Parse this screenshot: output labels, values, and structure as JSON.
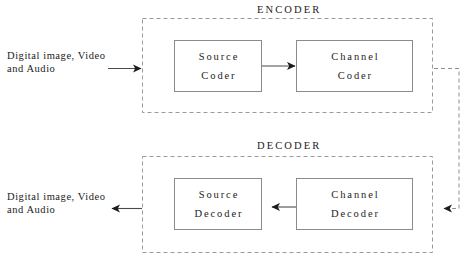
{
  "diagram": {
    "title_encoder": "ENCODER",
    "title_decoder": "DECODER",
    "input_label": "Digital image, Video\nand Audio",
    "output_label": "Digital image, Video\nand Audio",
    "blocks": [
      {
        "name": "source-coder",
        "line1": "Source",
        "line2": "Coder"
      },
      {
        "name": "channel-coder",
        "line1": "Channel",
        "line2": "Coder"
      },
      {
        "name": "source-decoder",
        "line1": "Source",
        "line2": "Decoder"
      },
      {
        "name": "channel-decoder",
        "line1": "Channel",
        "line2": "Decoder"
      }
    ],
    "connections": [
      {
        "name": "input-to-encoder",
        "style": "solid",
        "direction": "right"
      },
      {
        "name": "source-coder-to-channel-coder",
        "style": "solid",
        "direction": "right"
      },
      {
        "name": "channel-coder-to-channel-decoder",
        "style": "dashed",
        "direction": "left"
      },
      {
        "name": "channel-decoder-to-source-decoder",
        "style": "solid",
        "direction": "left"
      },
      {
        "name": "source-decoder-to-output",
        "style": "solid",
        "direction": "left"
      }
    ],
    "colors": {
      "background": "#ffffff",
      "group_border": "#9a9a9a",
      "block_border": "#8b8b8b",
      "connector": "#4a4a4a",
      "text": "#1b1b1b"
    }
  }
}
